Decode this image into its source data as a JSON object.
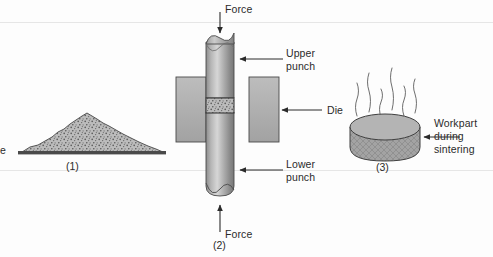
{
  "figure": {
    "background_color": "#fdfdfd"
  },
  "colors": {
    "metal_light": "#d3d3d3",
    "metal_mid": "#9a9a9a",
    "metal_dark": "#6f6f6f",
    "powder_fill": "#b8b8b8",
    "powder_speck": "#5a5a5a",
    "die_fill": "#aeaeae",
    "outline": "#3a3a3a",
    "text": "#2b2b2b",
    "leader": "#2b2b2b",
    "scanline": "#e6e6e6"
  },
  "stages": [
    {
      "id": "stage-1-powder",
      "number": "(1)",
      "caption_partial": "e",
      "description": "Loose powder pile on a flat base"
    },
    {
      "id": "stage-2-pressing",
      "number": "(2)",
      "description": "Powder compacted in a die between upper and lower punches"
    },
    {
      "id": "stage-3-sintering",
      "number": "(3)",
      "description": "Compacted workpart during sintering with rising heat"
    }
  ],
  "labels": {
    "force_top": "Force",
    "force_bottom": "Force",
    "upper_punch_line1": "Upper",
    "upper_punch_line2": "punch",
    "die": "Die",
    "lower_punch_line1": "Lower",
    "lower_punch_line2": "punch",
    "workpart_line1": "Workpart",
    "workpart_line2": "during",
    "workpart_line3": "sintering",
    "powder_cut": "e"
  }
}
